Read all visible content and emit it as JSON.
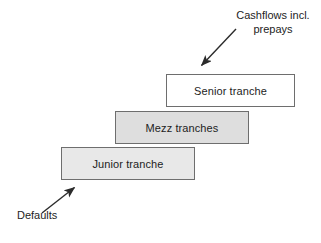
{
  "diagram": {
    "background_color": "#ffffff",
    "text_color": "#1d1d1d",
    "border_color": "#6e6e6e",
    "arrow_color": "#2b2b2b",
    "boxes": [
      {
        "id": "senior",
        "label": "Senior tranche",
        "fill": "#ffffff",
        "x": 166,
        "y": 74,
        "width": 129,
        "height": 33
      },
      {
        "id": "mezz",
        "label": "Mezz tranches",
        "fill": "#dedede",
        "x": 115,
        "y": 111,
        "width": 134,
        "height": 33
      },
      {
        "id": "junior",
        "label": "Junior tranche",
        "fill": "#e8e8e8",
        "x": 61,
        "y": 147,
        "width": 134,
        "height": 33
      }
    ],
    "annotations": [
      {
        "id": "cashflows",
        "label": "Cashflows incl.\nprepays",
        "arrow_from": [
          236,
          29
        ],
        "arrow_to": [
          199,
          68
        ]
      },
      {
        "id": "defaults",
        "label": "Defaults",
        "arrow_from": [
          42,
          213
        ],
        "arrow_to": [
          77,
          185
        ]
      }
    ]
  }
}
